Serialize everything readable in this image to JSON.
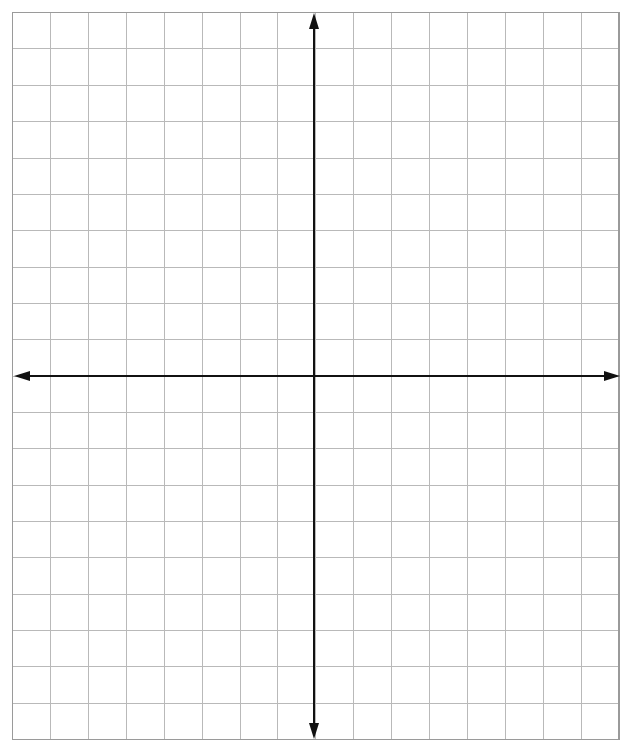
{
  "page": {
    "width": 632,
    "height": 752,
    "background_color": "#ffffff"
  },
  "chart_data": {
    "type": "scatter",
    "title": "",
    "subtitle": "",
    "xlabel": "",
    "ylabel": "",
    "series": [],
    "x": [],
    "values": [],
    "annotations": [],
    "legend": {
      "entries": [],
      "position": "none",
      "visible": false
    },
    "grid": {
      "visible": true,
      "columns": 16,
      "rows": 20,
      "columns_left_of_origin": 8,
      "columns_right_of_origin": 8,
      "rows_above_origin": 10,
      "rows_below_origin": 10,
      "cell_width_px": 37.9,
      "cell_height_px": 36.35,
      "line_color": "#b9b9b9",
      "line_width_px": 1,
      "border_color": "#9a9a9a",
      "border_width_px": 1.6
    },
    "axes": {
      "origin_px": [
        314,
        376
      ],
      "xlim": [
        -8,
        8
      ],
      "ylim": [
        -10,
        10
      ],
      "x_axis": {
        "label": "",
        "color": "#111111",
        "line_width_px": 2,
        "start_px": [
          14,
          376
        ],
        "end_px": [
          620,
          376
        ],
        "arrow_left": true,
        "arrow_right": true,
        "tick_labels": [],
        "ticks_visible": false
      },
      "y_axis": {
        "label": "",
        "color": "#111111",
        "line_width_px": 2,
        "start_px": [
          314,
          13
        ],
        "end_px": [
          314,
          739
        ],
        "arrow_up": true,
        "arrow_down": true,
        "tick_labels": [],
        "ticks_visible": false
      }
    },
    "plot_area_px": {
      "left": 12.6,
      "top": 12.6,
      "right": 619.0,
      "bottom": 739.6
    }
  }
}
